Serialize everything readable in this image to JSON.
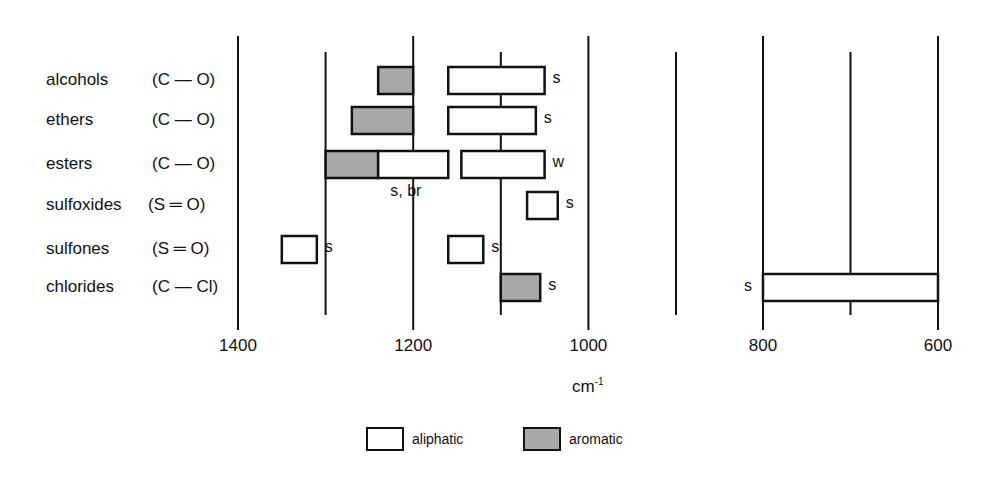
{
  "chart_data": {
    "type": "range-bar",
    "title": "",
    "xlabel": "cm-1",
    "xlabel_display": {
      "base": "cm",
      "sup": "-1"
    },
    "x_axis": {
      "reversed": true,
      "segments": [
        {
          "from": 1400,
          "to": 900,
          "px_start": 238,
          "px_end": 676
        },
        {
          "from": 800,
          "to": 600,
          "px_start": 763,
          "px_end": 938
        }
      ],
      "major_ticks": [
        1400,
        1200,
        1000,
        800,
        600
      ],
      "minor_ticks": [
        1300,
        1100,
        900,
        700
      ],
      "tick_labels": [
        "1400",
        "1200",
        "1000",
        "800",
        "600"
      ]
    },
    "grid": true,
    "legend": {
      "position": "bottom",
      "entries": [
        {
          "name": "aliphatic",
          "color": "#ffffff"
        },
        {
          "name": "aromatic",
          "color": "#a8a8a8"
        }
      ]
    },
    "rows": [
      {
        "compound": "alcohols",
        "bond": "(C — O)",
        "bands": [
          {
            "type": "aromatic",
            "from": 1240,
            "to": 1200
          },
          {
            "type": "aliphatic",
            "from": 1160,
            "to": 1050,
            "intensity": "s",
            "intensity_side": "right"
          }
        ]
      },
      {
        "compound": "ethers",
        "bond": "(C — O)",
        "bands": [
          {
            "type": "aromatic",
            "from": 1270,
            "to": 1200
          },
          {
            "type": "aliphatic",
            "from": 1160,
            "to": 1060,
            "intensity": "s",
            "intensity_side": "right"
          }
        ]
      },
      {
        "compound": "esters",
        "bond": "(C — O)",
        "bands": [
          {
            "type": "aromatic",
            "from": 1300,
            "to": 1240
          },
          {
            "type": "aliphatic",
            "from": 1240,
            "to": 1160,
            "intensity": "s, br",
            "intensity_side": "below"
          },
          {
            "type": "aliphatic",
            "from": 1145,
            "to": 1050,
            "intensity": "w",
            "intensity_side": "right"
          }
        ]
      },
      {
        "compound": "sulfoxides",
        "bond": "(S ═ O)",
        "bands": [
          {
            "type": "aliphatic",
            "from": 1070,
            "to": 1035,
            "intensity": "s",
            "intensity_side": "right"
          }
        ]
      },
      {
        "compound": "sulfones",
        "bond": "(S ═ O)",
        "bands": [
          {
            "type": "aliphatic",
            "from": 1350,
            "to": 1310,
            "intensity": "s",
            "intensity_side": "right"
          },
          {
            "type": "aliphatic",
            "from": 1160,
            "to": 1120,
            "intensity": "s",
            "intensity_side": "right"
          }
        ]
      },
      {
        "compound": "chlorides",
        "bond": "(C — Cl)",
        "bands": [
          {
            "type": "aromatic",
            "from": 1100,
            "to": 1055,
            "intensity": "s",
            "intensity_side": "right"
          },
          {
            "type": "aliphatic",
            "from": 800,
            "to": 600,
            "intensity": "s",
            "intensity_side": "left"
          }
        ]
      }
    ]
  },
  "colors": {
    "line": "#111111",
    "aromatic_fill": "#a8a8a8",
    "aliphatic_fill": "#ffffff"
  },
  "legend_labels": {
    "aliphatic": "aliphatic",
    "aromatic": "aromatic"
  },
  "unit_label": {
    "base": "cm",
    "sup": "-1"
  }
}
